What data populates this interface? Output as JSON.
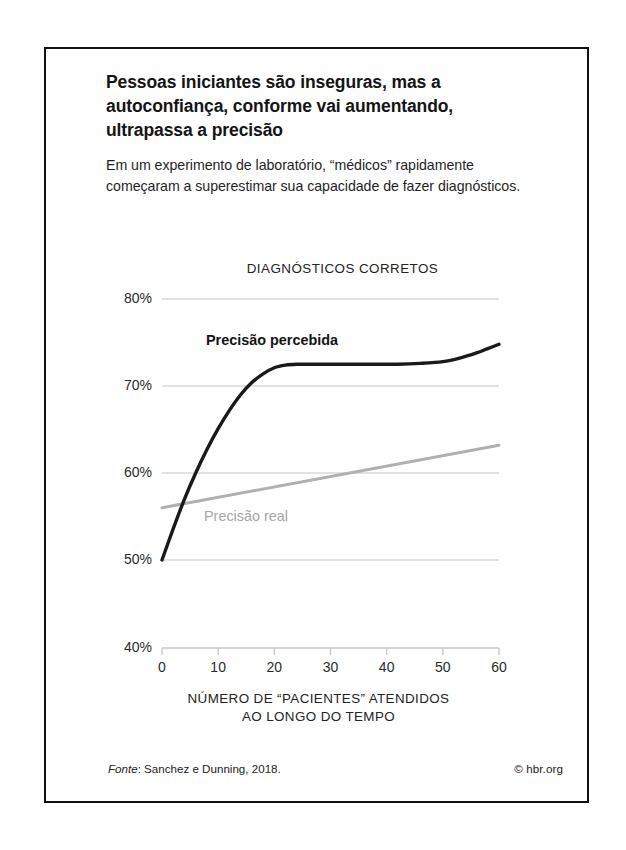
{
  "figure": {
    "headline": "Pessoas iniciantes são inseguras, mas a autoconfiança, conforme vai aumentando, ultrapassa a precisão",
    "deck": "Em um experimento de laboratório, “médicos” rapidamente começaram a superestimar sua capacidade de fazer diagnósticos.",
    "source_word": "Fonte",
    "source_rest": ": Sanchez e Dunning, 2018.",
    "credit": "© hbr.org"
  },
  "chart_data": {
    "type": "line",
    "title": "DIAGNÓSTICOS CORRETOS",
    "xlabel": "NÚMERO DE “PACIENTES” ATENDIDOS AO LONGO DO TEMPO",
    "xlabel_line1": "NÚMERO DE “PACIENTES” ATENDIDOS",
    "xlabel_line2": "AO LONGO DO TEMPO",
    "ylabel": "",
    "xlim": [
      0,
      60
    ],
    "ylim": [
      40,
      80
    ],
    "grid": true,
    "grid_axis": "y",
    "legend_position": "inline-annotation",
    "yticks": [
      80,
      70,
      60,
      50,
      40
    ],
    "yticklabels": [
      "80%",
      "70%",
      "60%",
      "50%",
      "40%"
    ],
    "xticks": [
      0,
      10,
      20,
      30,
      40,
      50,
      60
    ],
    "xticklabels": [
      "0",
      "10",
      "20",
      "30",
      "40",
      "50",
      "60"
    ],
    "series": [
      {
        "name": "Precisão percebida",
        "color": "#1a1a1a",
        "width": 3.4,
        "x": [
          0,
          2,
          4,
          6,
          8,
          10,
          12,
          14,
          16,
          18,
          20,
          22,
          24,
          26,
          28,
          30,
          34,
          38,
          42,
          46,
          50,
          53,
          56,
          58,
          60
        ],
        "values": [
          50.0,
          53.6,
          57.0,
          60.0,
          62.7,
          65.1,
          67.2,
          69.0,
          70.4,
          71.4,
          72.1,
          72.4,
          72.5,
          72.5,
          72.5,
          72.5,
          72.5,
          72.5,
          72.5,
          72.6,
          72.8,
          73.2,
          73.8,
          74.3,
          74.8
        ]
      },
      {
        "name": "Precisão real",
        "color": "#b0b0b0",
        "width": 3.0,
        "x": [
          0,
          60
        ],
        "values": [
          56.0,
          63.2
        ]
      }
    ],
    "annotations": [
      {
        "text": "Precisão percebida",
        "x": 14,
        "y": 76.5,
        "color": "#141414",
        "bold": true
      },
      {
        "text": "Precisão real",
        "x": 9,
        "y": 55.0,
        "color": "#a6a6a6",
        "bold": false
      }
    ]
  }
}
